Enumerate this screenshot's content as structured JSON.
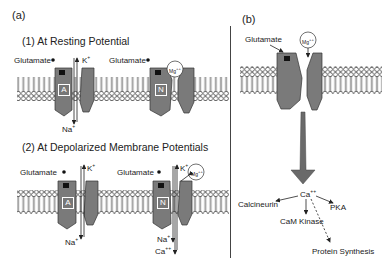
{
  "figure": {
    "panel_a": {
      "label": "(a)",
      "section1": {
        "title": "(1) At Resting Potential",
        "ampa": {
          "ligand_label": "Glutamate",
          "receptor_letter": "A",
          "ion_out": "K",
          "ion_out_sup": "+",
          "ion_in": "Na",
          "ion_in_sup": "+"
        },
        "nmda": {
          "ligand_label": "Glutamate",
          "receptor_letter": "N",
          "blocker": "Mg",
          "blocker_sup": "++"
        }
      },
      "section2": {
        "title": "(2) At Depolarized Membrane Potentials",
        "ampa": {
          "ligand_label": "Glutamate",
          "receptor_letter": "A",
          "ion_out": "K",
          "ion_out_sup": "+",
          "ion_in": "Na",
          "ion_in_sup": "+"
        },
        "nmda": {
          "ligand_label": "Glutamate",
          "receptor_letter": "N",
          "blocker": "Mg",
          "blocker_sup": "++",
          "ion_out": "K",
          "ion_out_sup": "+",
          "ion_in1": "Na",
          "ion_in1_sup": "+",
          "ion_in2": "Ca",
          "ion_in2_sup": "++"
        }
      }
    },
    "panel_b": {
      "label": "(b)",
      "ligand_label": "Glutamate",
      "blocker": "Mg",
      "blocker_sup": "++",
      "cascade": {
        "center": "Ca",
        "center_sup": "++",
        "targets": [
          "Calcineurin",
          "PKA",
          "CaM Kinase",
          "Protein Synthesis"
        ]
      }
    },
    "colors": {
      "receptor": "#7a7a7a",
      "receptor_dark": "#555555",
      "lipid": "#ffffff",
      "line": "#333333",
      "arrow": "#6a6a6a"
    }
  }
}
